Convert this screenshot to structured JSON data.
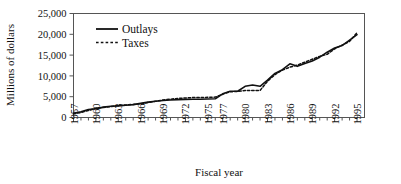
{
  "chart_data": {
    "type": "line",
    "title": "",
    "xlabel": "Fiscal year",
    "ylabel": "Millions of dollars",
    "xlim": [
      1957,
      1996
    ],
    "ylim": [
      0,
      25000
    ],
    "grid": false,
    "legend_position": "top-left-inside",
    "ytick_labels": [
      "0",
      "5,000",
      "10,000",
      "15,000",
      "20,000",
      "25,000"
    ],
    "ytick_values": [
      0,
      5000,
      10000,
      15000,
      20000,
      25000
    ],
    "xtick_labels": [
      "1957",
      "1960",
      "1963",
      "1966",
      "1969",
      "1972",
      "1975",
      "1977",
      "1980",
      "1983",
      "1986",
      "1989",
      "1992",
      "1995"
    ],
    "xtick_values": [
      1957,
      1960,
      1963,
      1966,
      1969,
      1972,
      1975,
      1977,
      1980,
      1983,
      1986,
      1989,
      1992,
      1995
    ],
    "x": [
      1957,
      1958,
      1959,
      1960,
      1961,
      1962,
      1963,
      1964,
      1965,
      1966,
      1967,
      1968,
      1969,
      1970,
      1971,
      1972,
      1973,
      1974,
      1975,
      1976,
      1977,
      1978,
      1979,
      1980,
      1981,
      1982,
      1983,
      1984,
      1985,
      1986,
      1987,
      1988,
      1989,
      1990,
      1991,
      1992,
      1993,
      1994,
      1995
    ],
    "series": [
      {
        "name": "Outlays",
        "style": "solid",
        "color": "#111111",
        "values": [
          1000,
          1400,
          1900,
          2100,
          2500,
          2700,
          2800,
          2950,
          3100,
          3400,
          3700,
          3900,
          4100,
          4200,
          4300,
          4350,
          4400,
          4400,
          4450,
          4500,
          5700,
          6300,
          6300,
          7500,
          7800,
          7500,
          9000,
          10600,
          11500,
          12900,
          12300,
          13000,
          13600,
          14500,
          15700,
          16700,
          17300,
          18600,
          19900
        ]
      },
      {
        "name": "Taxes",
        "style": "dashed",
        "color": "#111111",
        "values": [
          900,
          1200,
          1700,
          2200,
          2400,
          2600,
          2900,
          3000,
          3150,
          3300,
          3600,
          3900,
          4200,
          4400,
          4600,
          4700,
          4800,
          4800,
          4850,
          4900,
          5600,
          6200,
          6250,
          6500,
          6500,
          6500,
          8700,
          10300,
          11400,
          12100,
          12600,
          13300,
          14000,
          14700,
          15200,
          16500,
          17400,
          18300,
          20400
        ]
      }
    ]
  },
  "legend": {
    "items": [
      {
        "label": "Outlays",
        "style": "solid"
      },
      {
        "label": "Taxes",
        "style": "dashed"
      }
    ]
  },
  "axes": {
    "x_title": "Fiscal year",
    "y_title": "Millions of dollars"
  }
}
